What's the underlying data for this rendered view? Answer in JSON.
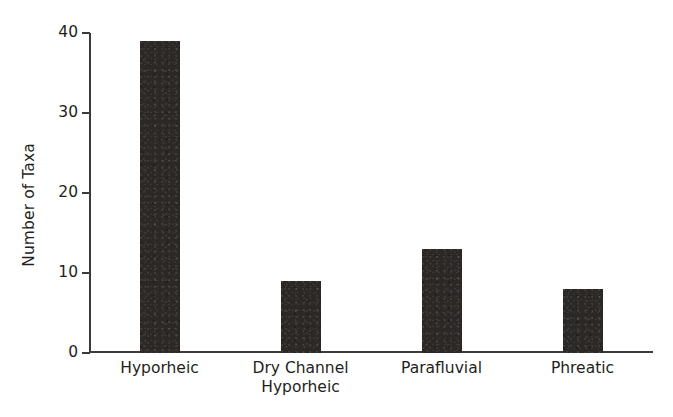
{
  "chart_data": {
    "type": "bar",
    "title": "",
    "subtitle": "",
    "xlabel": "",
    "ylabel": "Number of Taxa",
    "categories": [
      "Hyporheic",
      "Dry Channel\nHyporheic",
      "Parafluvial",
      "Phreatic"
    ],
    "values": [
      39,
      9,
      13,
      8
    ],
    "ylim": [
      0,
      40
    ],
    "yticks": [
      0,
      10,
      20,
      30,
      40
    ],
    "ytick_labels": [
      "0",
      "10",
      "20",
      "30",
      "40"
    ],
    "xtick_labels": [
      "Hyporheic",
      "Dry Channel\nHyporheic",
      "Parafluvial",
      "Phreatic"
    ],
    "grid": false,
    "legend": null,
    "legend_position": "none",
    "bar_color": "#2b2826",
    "axis_color": "#3d3a38",
    "background_color": "#ffffff",
    "text_color": "#231f20",
    "annotations": []
  },
  "axis": {
    "y_title": "Number of Taxa"
  },
  "ticks": [
    {
      "label": "40",
      "value": 40
    },
    {
      "label": "30",
      "value": 30
    },
    {
      "label": "20",
      "value": 20
    },
    {
      "label": "10",
      "value": 10
    },
    {
      "label": "0",
      "value": 0
    }
  ],
  "bars": [
    {
      "label": "Hyporheic",
      "value": 39
    },
    {
      "label": "Dry Channel\nHyporheic",
      "value": 9
    },
    {
      "label": "Parafluvial",
      "value": 13
    },
    {
      "label": "Phreatic",
      "value": 8
    }
  ]
}
